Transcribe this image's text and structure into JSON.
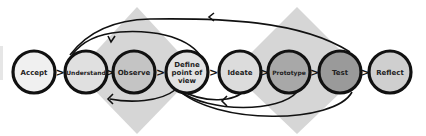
{
  "diagram": {
    "nodes": [
      {
        "id": "accept",
        "label_lines": [
          "Accept"
        ],
        "fill": "#f0f0f0",
        "cx": 34,
        "cy": 72
      },
      {
        "id": "understand",
        "label_lines": [
          "Understand"
        ],
        "fill": "#e0e0e0",
        "cx": 86,
        "cy": 72
      },
      {
        "id": "observe",
        "label_lines": [
          "Observe"
        ],
        "fill": "#c4c4c4",
        "cx": 134,
        "cy": 72
      },
      {
        "id": "define",
        "label_lines": [
          "Define",
          "point of",
          "view"
        ],
        "fill": "#e2e2e2",
        "cx": 187,
        "cy": 72
      },
      {
        "id": "ideate",
        "label_lines": [
          "Ideate"
        ],
        "fill": "#dcdcdc",
        "cx": 240,
        "cy": 72
      },
      {
        "id": "prototype",
        "label_lines": [
          "Prototype"
        ],
        "fill": "#a8a8a8",
        "cx": 289,
        "cy": 72
      },
      {
        "id": "test",
        "label_lines": [
          "Test"
        ],
        "fill": "#9a9a9a",
        "cx": 340,
        "cy": 72
      },
      {
        "id": "reflect",
        "label_lines": [
          "Reflect"
        ],
        "fill": "#cfcfcf",
        "cx": 390,
        "cy": 72
      }
    ],
    "connector_glyph": ">",
    "colors": {
      "stroke": "#111111",
      "diamond": "#d6d6d6",
      "background": "#ffffff"
    },
    "feedback_loops": [
      {
        "from": "test",
        "to": "understand",
        "position": "top"
      },
      {
        "from": "define",
        "to": "understand",
        "position": "top"
      },
      {
        "from": "define",
        "to": "observe",
        "position": "bottom"
      },
      {
        "from": "ideate",
        "to": "define",
        "position": "bottom"
      },
      {
        "from": "prototype",
        "to": "define",
        "position": "bottom"
      },
      {
        "from": "test",
        "to": "define",
        "position": "bottom"
      }
    ]
  }
}
